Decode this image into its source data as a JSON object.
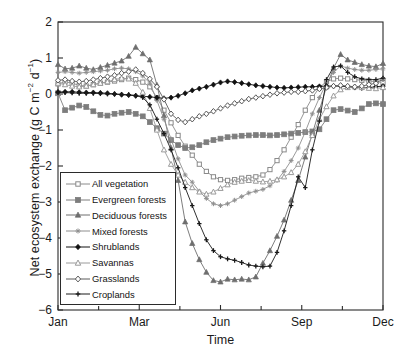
{
  "chart_data": {
    "type": "line",
    "title": "",
    "xlabel": "Time",
    "ylabel": "Net ecosystem exchange (g C m−2 d−1)",
    "ylim": [
      -6,
      2
    ],
    "yticks": [
      2,
      1,
      0,
      -1,
      -2,
      -3,
      -4,
      -5,
      -6
    ],
    "ytick_labels": [
      "2",
      "1",
      "0",
      "−1",
      "−2",
      "−3",
      "−4",
      "−5",
      "−6"
    ],
    "xlim": [
      0,
      46
    ],
    "xtick_labels": [
      "Jan",
      "Mar",
      "Jun",
      "Sep",
      "Dec"
    ],
    "xtick_positions": [
      0,
      11.5,
      23,
      34.5,
      46
    ],
    "xminor_positions": [
      5.75,
      17.25,
      28.75,
      40.25
    ],
    "grid": false,
    "legend_position": "lower-left",
    "x": [
      0,
      1,
      2,
      3,
      4,
      5,
      6,
      7,
      8,
      9,
      10,
      11,
      12,
      13,
      14,
      15,
      16,
      17,
      18,
      19,
      20,
      21,
      22,
      23,
      24,
      25,
      26,
      27,
      28,
      29,
      30,
      31,
      32,
      33,
      34,
      35,
      36,
      37,
      38,
      39,
      40,
      41,
      42,
      43,
      44,
      45,
      46
    ],
    "series": [
      {
        "name": "All vegetation",
        "marker": "open-square",
        "color": "#8a8a8a",
        "values": [
          0.28,
          0.34,
          0.3,
          0.24,
          0.22,
          0.26,
          0.3,
          0.33,
          0.36,
          0.4,
          0.44,
          0.4,
          0.33,
          0.2,
          -0.1,
          -0.45,
          -0.8,
          -1.15,
          -1.45,
          -1.7,
          -1.95,
          -2.15,
          -2.3,
          -2.38,
          -2.4,
          -2.38,
          -2.34,
          -2.32,
          -2.3,
          -2.25,
          -2.1,
          -1.85,
          -1.55,
          -1.2,
          -0.85,
          -0.45,
          -0.1,
          0.18,
          0.34,
          0.42,
          0.44,
          0.42,
          0.4,
          0.38,
          0.36,
          0.34,
          0.32
        ]
      },
      {
        "name": "Evergreen forests",
        "marker": "filled-square",
        "color": "#7d7d7d",
        "values": [
          0.02,
          -0.45,
          -0.38,
          -0.32,
          -0.36,
          -0.48,
          -0.58,
          -0.6,
          -0.55,
          -0.52,
          -0.5,
          -0.55,
          -0.62,
          -0.78,
          -0.95,
          -1.1,
          -1.28,
          -1.42,
          -1.5,
          -1.48,
          -1.42,
          -1.34,
          -1.28,
          -1.24,
          -1.2,
          -1.18,
          -1.16,
          -1.15,
          -1.14,
          -1.14,
          -1.15,
          -1.14,
          -1.12,
          -1.1,
          -1.08,
          -1.06,
          -1.04,
          -0.98,
          -0.7,
          -0.45,
          -0.42,
          -0.46,
          -0.5,
          -0.4,
          -0.28,
          -0.26,
          -0.28
        ]
      },
      {
        "name": "Deciduous forests",
        "marker": "filled-triangle",
        "color": "#6e6e6e",
        "values": [
          0.82,
          0.7,
          0.72,
          0.78,
          0.72,
          0.68,
          0.74,
          0.8,
          0.86,
          0.92,
          1.05,
          1.3,
          1.12,
          0.95,
          0.25,
          -0.6,
          -1.5,
          -2.4,
          -3.55,
          -4.15,
          -4.6,
          -4.95,
          -5.18,
          -5.22,
          -5.14,
          -5.16,
          -5.14,
          -5.16,
          -5.08,
          -4.7,
          -4.35,
          -3.95,
          -3.5,
          -2.95,
          -2.4,
          -1.75,
          -1.1,
          -0.45,
          0.2,
          0.72,
          1.1,
          0.95,
          0.88,
          0.82,
          0.78,
          0.76,
          0.85
        ]
      },
      {
        "name": "Mixed forests",
        "marker": "small-star",
        "color": "#8e8e8e",
        "values": [
          0.6,
          0.62,
          0.6,
          0.58,
          0.6,
          0.62,
          0.64,
          0.66,
          0.7,
          0.72,
          0.7,
          0.62,
          0.5,
          0.3,
          -0.18,
          -0.7,
          -1.25,
          -1.8,
          -2.25,
          -2.45,
          -2.7,
          -2.9,
          -3.05,
          -3.1,
          -3.05,
          -2.95,
          -2.85,
          -2.75,
          -2.7,
          -2.65,
          -2.55,
          -2.4,
          -2.15,
          -1.85,
          -1.5,
          -1.05,
          -0.55,
          -0.1,
          0.3,
          0.6,
          0.78,
          0.72,
          0.68,
          0.66,
          0.66,
          0.68,
          0.7
        ]
      },
      {
        "name": "Shrublands",
        "marker": "filled-diamond",
        "color": "#111111",
        "values": [
          0.05,
          0.06,
          0.06,
          0.05,
          0.04,
          0.04,
          0.03,
          0.02,
          0.0,
          -0.02,
          -0.03,
          -0.05,
          -0.06,
          -0.08,
          -0.1,
          -0.12,
          -0.1,
          -0.05,
          0.02,
          0.1,
          0.15,
          0.2,
          0.26,
          0.32,
          0.35,
          0.33,
          0.3,
          0.27,
          0.24,
          0.22,
          0.2,
          0.18,
          0.17,
          0.18,
          0.19,
          0.2,
          0.2,
          0.21,
          0.22,
          0.22,
          0.22,
          0.2,
          0.18,
          0.17,
          0.18,
          0.2,
          0.22
        ]
      },
      {
        "name": "Savannas",
        "marker": "open-triangle",
        "color": "#9a9a9a",
        "values": [
          0.3,
          0.26,
          0.22,
          0.2,
          0.22,
          0.26,
          0.3,
          0.34,
          0.4,
          0.44,
          0.42,
          0.3,
          0.05,
          -0.4,
          -1.0,
          -1.55,
          -1.95,
          -2.25,
          -2.45,
          -2.6,
          -2.72,
          -2.78,
          -2.72,
          -2.62,
          -2.52,
          -2.45,
          -2.42,
          -2.4,
          -2.42,
          -2.44,
          -2.42,
          -2.38,
          -2.3,
          -2.18,
          -1.95,
          -1.6,
          -1.15,
          -0.7,
          -0.35,
          -0.05,
          0.12,
          0.18,
          0.2,
          0.18,
          0.16,
          0.15,
          0.18
        ]
      },
      {
        "name": "Grasslands",
        "marker": "open-diamond",
        "color": "#5a5a5a",
        "values": [
          0.38,
          0.4,
          0.36,
          0.34,
          0.36,
          0.4,
          0.44,
          0.48,
          0.52,
          0.58,
          0.62,
          0.68,
          0.58,
          0.42,
          0.2,
          -0.15,
          -0.55,
          -0.72,
          -0.78,
          -0.7,
          -0.62,
          -0.55,
          -0.48,
          -0.4,
          -0.32,
          -0.26,
          -0.2,
          -0.14,
          -0.1,
          -0.06,
          -0.02,
          0.02,
          0.04,
          0.06,
          0.06,
          0.08,
          0.1,
          0.14,
          0.18,
          0.22,
          0.24,
          0.22,
          0.2,
          0.22,
          0.26,
          0.3,
          0.42
        ]
      },
      {
        "name": "Croplands",
        "marker": "plus-bar",
        "color": "#1a1a1a",
        "values": [
          0.05,
          0.04,
          0.03,
          0.02,
          0.02,
          0.02,
          0.01,
          0.0,
          0.0,
          -0.01,
          -0.02,
          -0.04,
          -0.1,
          -0.3,
          -0.7,
          -1.1,
          -1.55,
          -2.05,
          -2.6,
          -3.1,
          -3.6,
          -4.05,
          -4.35,
          -4.52,
          -4.58,
          -4.62,
          -4.68,
          -4.75,
          -4.78,
          -4.8,
          -4.78,
          -4.4,
          -3.8,
          -3.1,
          -2.3,
          -2.6,
          -1.55,
          -0.75,
          0.4,
          0.75,
          0.78,
          0.6,
          0.48,
          0.42,
          0.4,
          0.4,
          0.44
        ]
      }
    ]
  },
  "legend": {
    "items": [
      {
        "label": "All vegetation"
      },
      {
        "label": "Evergreen forests"
      },
      {
        "label": "Deciduous forests"
      },
      {
        "label": "Mixed forests"
      },
      {
        "label": "Shrublands"
      },
      {
        "label": "Savannas"
      },
      {
        "label": "Grasslands"
      },
      {
        "label": "Croplands"
      }
    ]
  },
  "axes": {
    "ylabel_main": "Net ecosystem exchange (g C m",
    "ylabel_sup1": "−2",
    "ylabel_mid": " d",
    "ylabel_sup2": "−1",
    "ylabel_end": ")",
    "xlabel": "Time"
  }
}
